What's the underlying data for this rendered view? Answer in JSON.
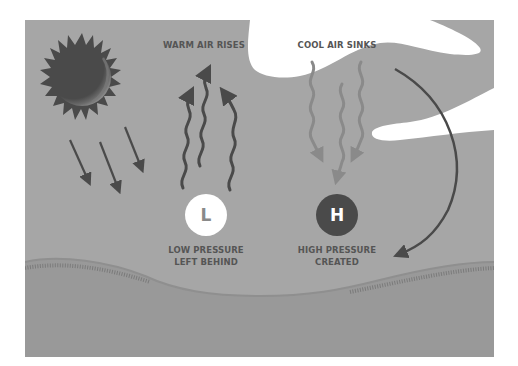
{
  "diagram": {
    "type": "weather-pressure-illustration",
    "colors": {
      "sky": "#a6a6a6",
      "ground": "#999999",
      "cloud": "#ffffff",
      "dark": "#4a4a4a",
      "cool_arrows": "#8a8a8a",
      "page_bg": "#ffffff"
    },
    "labels": {
      "warm_air": "WARM AIR RISES",
      "cool_air": "COOL AIR SINKS",
      "low_line1": "LOW PRESSURE",
      "low_line2": "LEFT BEHIND",
      "high_line1": "HIGH PRESSURE",
      "high_line2": "CREATED"
    },
    "markers": {
      "low": "L",
      "high": "H"
    },
    "icons": [
      "sun-icon",
      "sun-ray-arrows",
      "warm-air-wavy-arrows",
      "cool-air-wavy-arrows",
      "curved-circulation-arrow",
      "cloud"
    ]
  }
}
